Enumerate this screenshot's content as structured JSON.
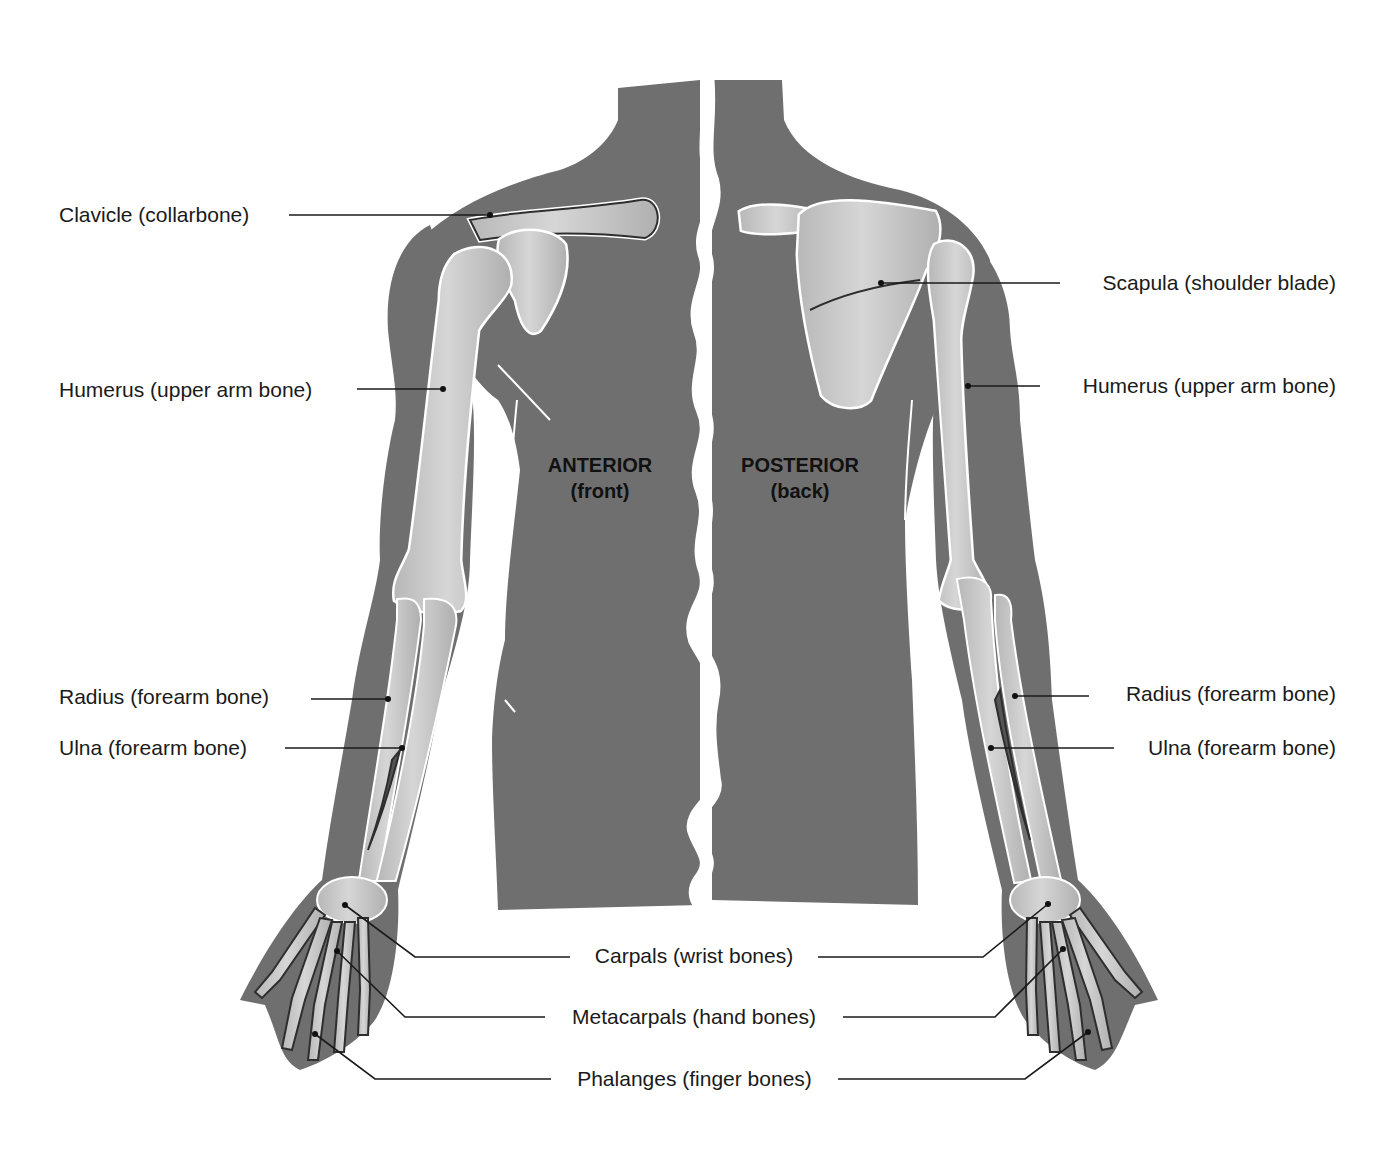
{
  "figure": {
    "type": "anatomical-diagram",
    "colors": {
      "background": "#ffffff",
      "body_silhouette": "#6f6f6f",
      "bone_fill": "#c9c9c9",
      "bone_shade": "#a9a9a9",
      "bone_outline": "#2e2e2e",
      "halo": "#ffffff",
      "leader_line": "#1a1a1a",
      "text": "#1a1a1a"
    }
  },
  "views": {
    "anterior": {
      "title": "ANTERIOR",
      "subtitle": "(front)"
    },
    "posterior": {
      "title": "POSTERIOR",
      "subtitle": "(back)"
    }
  },
  "labels": {
    "left": [
      {
        "id": "clavicle",
        "text": "Clavicle (collarbone)"
      },
      {
        "id": "humerus",
        "text": "Humerus (upper arm bone)"
      },
      {
        "id": "radius",
        "text": "Radius (forearm bone)"
      },
      {
        "id": "ulna",
        "text": "Ulna (forearm bone)"
      }
    ],
    "right": [
      {
        "id": "scapula",
        "text": "Scapula (shoulder blade)"
      },
      {
        "id": "humerus",
        "text": "Humerus (upper arm bone)"
      },
      {
        "id": "radius",
        "text": "Radius (forearm bone)"
      },
      {
        "id": "ulna",
        "text": "Ulna (forearm bone)"
      }
    ],
    "bottom": [
      {
        "id": "carpals",
        "text": "Carpals (wrist bones)"
      },
      {
        "id": "metacarpals",
        "text": "Metacarpals (hand bones)"
      },
      {
        "id": "phalanges",
        "text": "Phalanges (finger bones)"
      }
    ]
  }
}
